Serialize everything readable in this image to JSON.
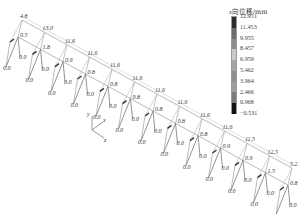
{
  "legend": {
    "title_var": "x",
    "title_rest": "向位移/mm",
    "values": [
      "12.951",
      "11.453",
      "9.955",
      "8.457",
      "6.959",
      "5.462",
      "3.964",
      "2.466",
      "0.968",
      "−0.531"
    ],
    "colors": [
      "#2b2b2b",
      "#6d6d6d",
      "#8c8c8c",
      "#c9c9c9",
      "#a5a5a5",
      "#8f8f8f",
      "#9d9d9d",
      "#7a7a7a",
      "#111111"
    ]
  },
  "axes": {
    "y": "y",
    "x": "x",
    "z": "z"
  },
  "labels": {
    "top": [
      "4.8",
      "13.0",
      "11.6",
      "11.6",
      "11.6",
      "11.6",
      "11.6",
      "11.6",
      "11.6",
      "11.6",
      "11.5",
      "12.5",
      "5.2"
    ],
    "joint": [
      "0.5",
      "1.8",
      "0.9",
      "0.8",
      "0.8",
      "0.8",
      "0.8",
      "0.8",
      "0.8",
      "0.9",
      "0.9",
      "1.5",
      "0.8"
    ],
    "base": "0.0"
  }
}
